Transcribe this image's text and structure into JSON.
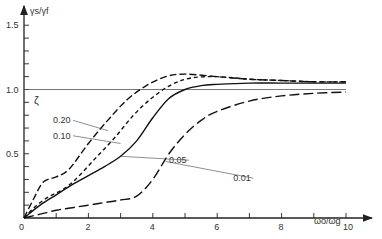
{
  "chart_data": {
    "type": "line",
    "title": "",
    "xlabel": "ωo/ωg",
    "ylabel": "γs/γf",
    "xlim": [
      0,
      10.8
    ],
    "ylim": [
      0,
      1.6
    ],
    "x_ticks": [
      0,
      1,
      2,
      3,
      4,
      5,
      6,
      7,
      8,
      9,
      10
    ],
    "x_tick_labels": [
      "0",
      "2",
      "4",
      "6",
      "8",
      "10"
    ],
    "y_ticks": [
      0,
      0.1,
      0.2,
      0.3,
      0.4,
      0.5,
      0.6,
      0.7,
      0.8,
      0.9,
      1.0,
      1.1,
      1.2,
      1.3,
      1.4,
      1.5
    ],
    "y_tick_labels": [
      "0.5",
      "1.0",
      "1.5"
    ],
    "grid": false,
    "reference_line": {
      "y": 1.0
    },
    "legend_title": "ζ",
    "series": [
      {
        "name": "0.20",
        "style": "dash-medium",
        "x": [
          0,
          0.3,
          0.6,
          1.0,
          1.4,
          2.0,
          2.6,
          3.2,
          3.8,
          4.4,
          5.0,
          6.0,
          7.0,
          8.0,
          9.0,
          10.0
        ],
        "y": [
          0,
          0.15,
          0.28,
          0.32,
          0.38,
          0.58,
          0.76,
          0.92,
          1.03,
          1.1,
          1.12,
          1.1,
          1.08,
          1.07,
          1.06,
          1.06
        ]
      },
      {
        "name": "0.10",
        "style": "dash-short",
        "x": [
          0,
          0.4,
          0.8,
          1.2,
          1.6,
          2.2,
          2.8,
          3.4,
          4.0,
          4.6,
          5.2,
          6.0,
          7.0,
          8.0,
          9.0,
          10.0
        ],
        "y": [
          0,
          0.1,
          0.17,
          0.22,
          0.3,
          0.46,
          0.62,
          0.8,
          0.94,
          1.04,
          1.09,
          1.1,
          1.08,
          1.07,
          1.06,
          1.06
        ]
      },
      {
        "name": "0.05",
        "style": "solid",
        "x": [
          0,
          0.5,
          1.0,
          1.5,
          2.0,
          2.5,
          3.0,
          3.5,
          4.0,
          4.5,
          5.0,
          5.5,
          6.0,
          7.0,
          8.0,
          9.0,
          10.0
        ],
        "y": [
          0,
          0.1,
          0.18,
          0.26,
          0.33,
          0.4,
          0.48,
          0.6,
          0.78,
          0.93,
          1.0,
          1.03,
          1.04,
          1.05,
          1.05,
          1.05,
          1.05
        ]
      },
      {
        "name": "0.01",
        "style": "dash-long",
        "x": [
          0,
          0.5,
          1.0,
          1.5,
          2.0,
          2.5,
          3.0,
          3.5,
          4.0,
          4.5,
          5.0,
          5.5,
          6.0,
          7.0,
          8.0,
          9.0,
          10.0
        ],
        "y": [
          0,
          0.03,
          0.06,
          0.08,
          0.1,
          0.12,
          0.14,
          0.17,
          0.3,
          0.5,
          0.65,
          0.76,
          0.83,
          0.91,
          0.95,
          0.97,
          0.98
        ]
      }
    ],
    "annotations": [
      {
        "text": "0.20",
        "label_at": [
          0.9,
          0.76
        ],
        "points_to": [
          2.6,
          0.68
        ]
      },
      {
        "text": "0.10",
        "label_at": [
          0.9,
          0.64
        ],
        "points_to": [
          3.0,
          0.58
        ]
      },
      {
        "text": "0.05",
        "label_at": [
          4.5,
          0.45
        ],
        "points_to": [
          3.0,
          0.48
        ]
      },
      {
        "text": "0.01",
        "label_at": [
          6.5,
          0.31
        ],
        "points_to": [
          4.4,
          0.44
        ]
      }
    ]
  }
}
